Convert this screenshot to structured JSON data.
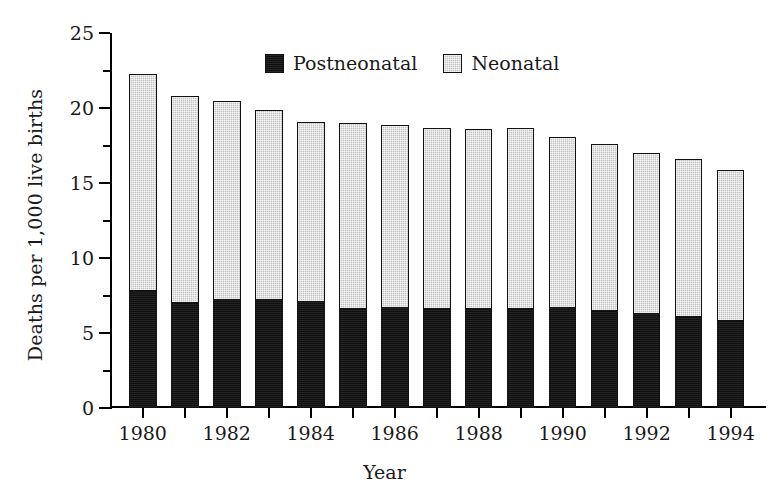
{
  "chart_data": {
    "type": "bar",
    "subtype": "stacked-vertical",
    "title": "",
    "xlabel": "Year",
    "ylabel": "Deaths per 1,000 live births",
    "ylim": [
      0,
      25
    ],
    "ytick_major": [
      0,
      5,
      10,
      15,
      20,
      25
    ],
    "ytick_minor": [
      2.5,
      7.5,
      12.5,
      17.5,
      22.5
    ],
    "grid": false,
    "legend_position": "top-center",
    "categories": [
      1980,
      1981,
      1982,
      1983,
      1984,
      1985,
      1986,
      1987,
      1988,
      1989,
      1990,
      1991,
      1992,
      1993,
      1994
    ],
    "xtick_labels": [
      "",
      "1980",
      "",
      "1982",
      "",
      "1984",
      "",
      "1986",
      "",
      "1988",
      "",
      "1990",
      "",
      "1992",
      "",
      "1994"
    ],
    "xtick_labels_shown": [
      "1980",
      "1982",
      "1984",
      "1986",
      "1988",
      "1990",
      "1992",
      "1994"
    ],
    "series": [
      {
        "name": "Postneonatal",
        "color": "#111111",
        "values": [
          7.8,
          7.0,
          7.2,
          7.2,
          7.1,
          6.6,
          6.7,
          6.6,
          6.6,
          6.6,
          6.7,
          6.5,
          6.3,
          6.1,
          5.8
        ]
      },
      {
        "name": "Neonatal",
        "color": "#c3c3c3",
        "values": [
          14.5,
          13.8,
          13.3,
          12.7,
          12.0,
          12.4,
          12.2,
          12.1,
          12.0,
          12.1,
          11.4,
          11.1,
          10.7,
          10.5,
          10.1
        ]
      }
    ],
    "totals": [
      22.3,
      20.8,
      20.5,
      19.9,
      19.1,
      19.0,
      18.9,
      18.7,
      18.6,
      18.7,
      18.1,
      17.6,
      17.0,
      16.6,
      15.9
    ]
  },
  "legend": {
    "items": [
      {
        "label": "Postneonatal",
        "swatch": "black-square-icon"
      },
      {
        "label": "Neonatal",
        "swatch": "gray-square-icon"
      }
    ]
  }
}
